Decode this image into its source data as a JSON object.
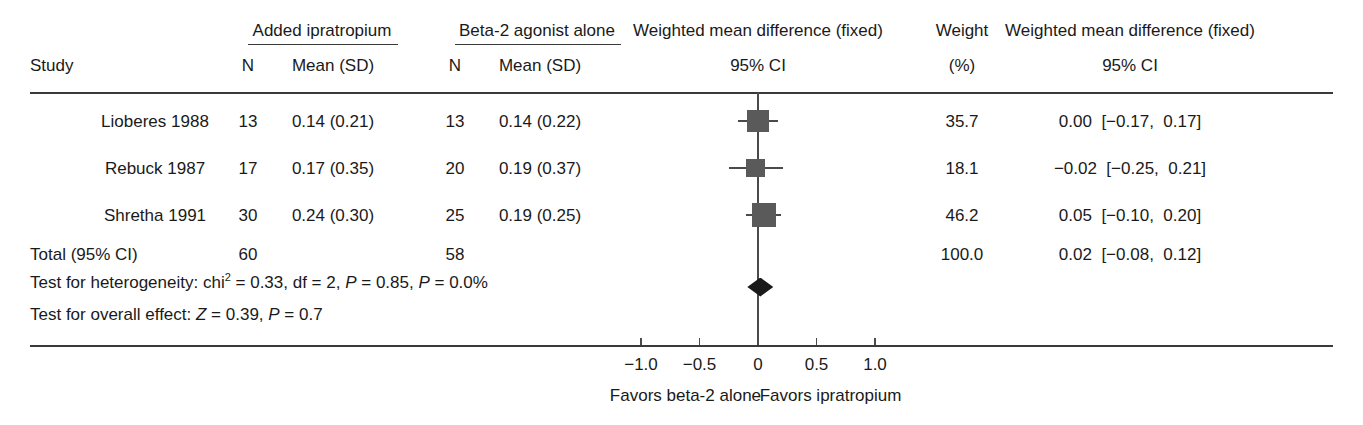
{
  "chart_data": {
    "type": "forest",
    "title": "",
    "columns": {
      "study": "Study",
      "group1_title": "Added ipratropium",
      "group2_title": "Beta-2 agonist alone",
      "n": "N",
      "mean_sd": "Mean (SD)",
      "plot_title": "Weighted mean difference (fixed)",
      "plot_sub": "95% CI",
      "weight_title": "Weight",
      "weight_sub": "(%)",
      "effect_title": "Weighted mean difference (fixed)",
      "effect_sub": "95% CI"
    },
    "rows": [
      {
        "study": "Lioberes 1988",
        "n1": "13",
        "mean_sd1": "0.14 (0.21)",
        "n2": "13",
        "mean_sd2": "0.14 (0.22)",
        "weight": "35.7",
        "effect": "0.00  [−0.17,  0.17]",
        "est": 0.0,
        "lower": -0.17,
        "upper": 0.17,
        "weight_value": 35.7
      },
      {
        "study": "Rebuck 1987",
        "n1": "17",
        "mean_sd1": "0.17 (0.35)",
        "n2": "20",
        "mean_sd2": "0.19 (0.37)",
        "weight": "18.1",
        "effect": "−0.02  [−0.25,  0.21]",
        "est": -0.02,
        "lower": -0.25,
        "upper": 0.21,
        "weight_value": 18.1
      },
      {
        "study": "Shretha 1991",
        "n1": "30",
        "mean_sd1": "0.24 (0.30)",
        "n2": "25",
        "mean_sd2": "0.19 (0.25)",
        "weight": "46.2",
        "effect": "0.05  [−0.10,  0.20]",
        "est": 0.05,
        "lower": -0.1,
        "upper": 0.2,
        "weight_value": 46.2
      }
    ],
    "total": {
      "label": "Total (95% CI)",
      "n1": "60",
      "n2": "58",
      "weight": "100.0",
      "effect": "0.02  [−0.08,  0.12]",
      "est": 0.02,
      "lower": -0.08,
      "upper": 0.12
    },
    "stats": {
      "heterogeneity_prefix": "Test for heterogeneity: chi",
      "heterogeneity_sup": "2",
      "heterogeneity_rest_a": " = 0.33, df = 2, ",
      "heterogeneity_p1": "P",
      "heterogeneity_rest_b": " = 0.85, ",
      "heterogeneity_p2": "P",
      "heterogeneity_rest_c": " = 0.0%",
      "overall_prefix": "Test for overall effect: ",
      "overall_z": "Z",
      "overall_mid": " = 0.39, ",
      "overall_p": "P",
      "overall_rest": " = 0.7"
    },
    "axis": {
      "ticks": [
        "−1.0",
        "−0.5",
        "0",
        "0.5",
        "1.0"
      ],
      "tick_values": [
        -1.0,
        -0.5,
        0,
        0.5,
        1.0
      ],
      "xlim": [
        -1.35,
        1.35
      ],
      "null_value": 0,
      "left_label": "Favors beta-2 alone",
      "right_label": "Favors ipratropium"
    },
    "colors": {
      "marker": "#5a5a5a",
      "diamond": "#1a1a1a",
      "line": "#4a4a4a",
      "text": "#1a1a1a",
      "rule": "#3a3a3a"
    }
  }
}
